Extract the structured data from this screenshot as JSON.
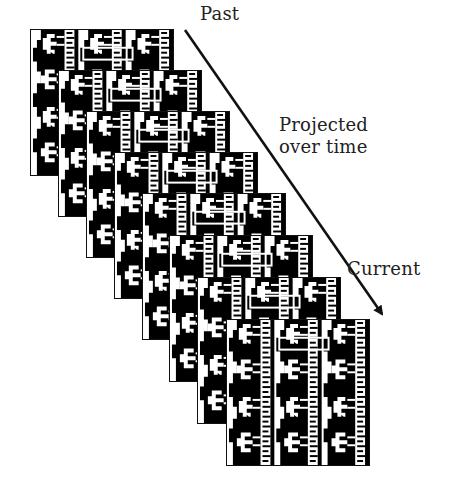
{
  "diagram": {
    "type": "stacked-frames-timeline",
    "frame_count": 8,
    "labels": {
      "start": "Past",
      "middle_line1": "Projected",
      "middle_line2": "over time",
      "end": "Current"
    },
    "arrow": {
      "direction": "diagonal-down-right",
      "from_label": "Past",
      "to_label": "Current"
    },
    "frames": [
      {
        "index": 1,
        "left": 30,
        "top": 29
      },
      {
        "index": 2,
        "left": 58,
        "top": 70
      },
      {
        "index": 3,
        "left": 86,
        "top": 111
      },
      {
        "index": 4,
        "left": 114,
        "top": 152
      },
      {
        "index": 5,
        "left": 142,
        "top": 193
      },
      {
        "index": 6,
        "left": 169,
        "top": 235
      },
      {
        "index": 7,
        "left": 197,
        "top": 277
      },
      {
        "index": 8,
        "left": 226,
        "top": 319
      }
    ],
    "colors": {
      "foreground": "#000000",
      "background": "#ffffff",
      "text": "#222222"
    }
  }
}
